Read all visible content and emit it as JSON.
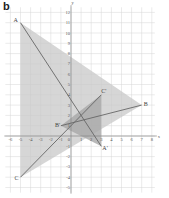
{
  "figure": {
    "part_label": "b",
    "axes": {
      "x_label": "x",
      "y_label": "y",
      "x_ticks": [
        "-6",
        "-5",
        "-4",
        "-3",
        "-2",
        "-1",
        "1",
        "2",
        "3",
        "4",
        "5",
        "6",
        "7",
        "8"
      ],
      "y_ticks": [
        "12",
        "11",
        "10",
        "9",
        "8",
        "7",
        "6",
        "5",
        "4",
        "3",
        "2",
        "1",
        "-1",
        "-2",
        "-3",
        "-4",
        "-5"
      ],
      "origin_label": "0"
    },
    "points": {
      "A": {
        "label": "A",
        "x": -5,
        "y": 11
      },
      "B": {
        "label": "B",
        "x": 7,
        "y": 3
      },
      "C": {
        "label": "C",
        "x": -5,
        "y": -4
      },
      "A_prime": {
        "label": "A'",
        "x": 3,
        "y": -1
      },
      "B_prime": {
        "label": "B'",
        "x": -1,
        "y": 1
      },
      "C_prime": {
        "label": "C'",
        "x": 3,
        "y": 4
      }
    },
    "colors": {
      "shade_large": "#c8c8c8",
      "shade_small": "#a8a8a8",
      "line": "#666666",
      "grid": "#d6d6d6"
    }
  }
}
